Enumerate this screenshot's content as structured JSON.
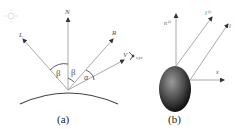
{
  "panel_a": {
    "caption": "(a)",
    "labels": {
      "L": "L",
      "N": "N",
      "R": "R",
      "V": "V",
      "beta1": "β",
      "beta2": "β",
      "alpha": "α",
      "eye": "eye"
    }
  },
  "panel_b": {
    "caption": "(b)",
    "labels": {
      "n": "n⁽ⁱ⁾",
      "l_i": "l⁽ⁱ⁾",
      "l": "l",
      "x": "x"
    }
  },
  "colors": {
    "line": "#aaaaaa",
    "arrow": "#333333",
    "curve": "#444444",
    "ellipsoid_light": "#8a8a8a",
    "ellipsoid_dark": "#1a1a1a"
  }
}
